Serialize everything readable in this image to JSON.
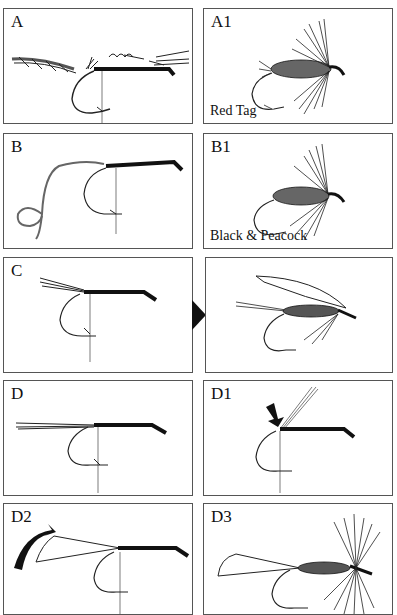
{
  "figure": {
    "panels": [
      {
        "id": "A",
        "label": "A",
        "caption": ""
      },
      {
        "id": "A1",
        "label": "A1",
        "caption": "Red Tag"
      },
      {
        "id": "B",
        "label": "B",
        "caption": ""
      },
      {
        "id": "B1",
        "label": "B1",
        "caption": "Black & Peacock"
      },
      {
        "id": "C",
        "label": "C",
        "caption": ""
      },
      {
        "id": "C1",
        "label": "",
        "caption": ""
      },
      {
        "id": "D",
        "label": "D",
        "caption": ""
      },
      {
        "id": "D1",
        "label": "D1",
        "caption": ""
      },
      {
        "id": "D2",
        "label": "D2",
        "caption": ""
      },
      {
        "id": "D3",
        "label": "D3",
        "caption": ""
      }
    ],
    "icons": {
      "c_to_c1_arrow": "right-pointing-triangle",
      "d1_pointer": "down-right-arrow",
      "d2_rotate": "curved-arrow"
    }
  }
}
